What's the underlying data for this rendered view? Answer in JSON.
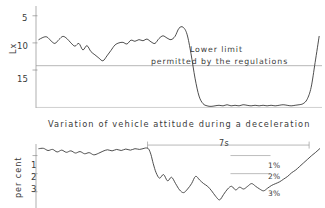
{
  "figure": {
    "caption": "Variation of vehicle attitude during a deceleration",
    "background_color": "#ffffff",
    "ink_color": "#2e2e2e",
    "axis_color": "#8d8d8d"
  },
  "top_chart": {
    "y_axis_title": "Lx",
    "y_ticks": [
      "5",
      "10",
      "15"
    ],
    "annotation_line1": "Lower limit",
    "annotation_line2": "permitted by the regulations"
  },
  "bottom_chart": {
    "y_axis_title": "per cent",
    "y_ticks": [
      "1",
      "2",
      "3"
    ],
    "span_label": "7s",
    "legend": [
      {
        "label": "1%"
      },
      {
        "label": "2%"
      },
      {
        "label": "3%"
      }
    ]
  },
  "chart_data": [
    {
      "type": "line",
      "id": "illuminance-vs-time",
      "title": "Variation of vehicle attitude during a deceleration",
      "xlabel": "",
      "ylabel": "Lx",
      "y_inverted": true,
      "ylim": [
        3.2,
        22.0
      ],
      "yticks": [
        5,
        10,
        15
      ],
      "xlim": [
        0,
        100
      ],
      "grid": false,
      "annotations": [
        {
          "text": "Lower limit permitted by the regulations",
          "x": 62,
          "y": 14.2,
          "refline_y": 14.2,
          "refline_style": "solid-thin"
        }
      ],
      "series": [
        {
          "name": "illuminance",
          "units": "Lx",
          "x": [
            1.0,
            2.4,
            3.8,
            5.2,
            6.6,
            8.0,
            9.4,
            10.8,
            12.2,
            13.6,
            15.0,
            16.4,
            17.8,
            19.2,
            20.6,
            22.0,
            23.4,
            24.8,
            26.2,
            27.6,
            29.0,
            30.4,
            31.8,
            33.2,
            34.6,
            36.0,
            37.4,
            38.8,
            40.2,
            41.6,
            43.0,
            44.4,
            45.8,
            47.2,
            48.6,
            50.0,
            51.4,
            52.8,
            54.2,
            55.6,
            57.0,
            58.4,
            59.8,
            61.2,
            62.6,
            64.0,
            65.4,
            66.8,
            68.2,
            69.6,
            71.0,
            72.4,
            73.8,
            75.2,
            76.6,
            78.0,
            79.4,
            80.8,
            82.2,
            83.6,
            85.0,
            86.4,
            87.8,
            89.2,
            90.6,
            92.0,
            93.4,
            94.8,
            96.2,
            97.6,
            99.0
          ],
          "y": [
            9.4,
            9.0,
            8.9,
            9.6,
            10.1,
            9.4,
            8.8,
            9.2,
            10.0,
            10.6,
            10.1,
            11.3,
            10.5,
            11.6,
            12.2,
            12.8,
            13.3,
            12.4,
            11.4,
            10.4,
            10.0,
            9.9,
            10.2,
            9.5,
            9.7,
            9.4,
            9.6,
            9.3,
            9.8,
            10.1,
            9.2,
            8.7,
            9.1,
            9.4,
            8.8,
            7.3,
            7.1,
            8.4,
            12.0,
            16.5,
            19.8,
            21.2,
            21.6,
            21.7,
            21.6,
            21.5,
            21.6,
            21.4,
            21.6,
            21.5,
            21.6,
            21.4,
            21.5,
            21.6,
            21.5,
            21.6,
            21.5,
            21.6,
            21.5,
            21.6,
            21.5,
            21.4,
            21.5,
            21.6,
            21.5,
            21.4,
            21.2,
            20.4,
            18.2,
            13.6,
            8.8
          ]
        }
      ]
    },
    {
      "type": "line",
      "id": "attitude-percent-vs-time",
      "title": "",
      "xlabel": "",
      "ylabel": "per cent",
      "y_inverted": true,
      "ylim": [
        0.25,
        3.9
      ],
      "yticks": [
        1,
        2,
        3
      ],
      "xlim": [
        0,
        100
      ],
      "grid": false,
      "annotations": [
        {
          "text": "7s",
          "type": "span",
          "x_start": 39.0,
          "x_end": 95.5,
          "y": 0.42
        },
        {
          "text": "1%",
          "type": "legend-refline",
          "y": 1.0,
          "x_start": 68,
          "x_end": 82
        },
        {
          "text": "2%",
          "type": "legend-refline",
          "y": 2.0,
          "x_start": 68,
          "x_end": 82
        },
        {
          "text": "3%",
          "type": "legend-refline",
          "y": 3.0,
          "x_start": 68,
          "x_end": 82
        }
      ],
      "series": [
        {
          "name": "attitude-variation",
          "units": "per cent",
          "x": [
            1.0,
            2.6,
            4.2,
            5.8,
            7.4,
            9.0,
            10.6,
            12.2,
            13.8,
            15.4,
            17.0,
            18.6,
            20.2,
            21.8,
            23.4,
            25.0,
            26.6,
            28.2,
            29.8,
            31.4,
            33.0,
            34.6,
            36.2,
            37.8,
            38.6,
            39.4,
            40.2,
            41.0,
            42.0,
            43.2,
            44.6,
            46.0,
            47.4,
            48.8,
            50.2,
            51.6,
            53.0,
            54.4,
            55.8,
            57.2,
            58.6,
            60.0,
            61.4,
            62.8,
            64.2,
            65.6,
            67.0,
            68.4,
            69.8,
            71.2,
            72.6,
            74.0,
            75.4,
            76.8,
            78.2,
            79.6,
            81.0,
            82.4,
            83.8,
            85.2,
            86.6,
            88.0,
            89.4,
            90.8,
            92.2,
            93.6,
            95.0,
            96.4,
            97.8,
            99.2
          ],
          "y": [
            0.62,
            0.6,
            0.72,
            0.66,
            0.8,
            0.7,
            0.82,
            0.74,
            0.86,
            0.78,
            0.9,
            0.84,
            0.96,
            0.88,
            0.76,
            0.68,
            0.74,
            0.66,
            0.72,
            0.64,
            0.7,
            0.62,
            0.66,
            0.6,
            0.58,
            0.64,
            0.95,
            1.45,
            1.95,
            2.25,
            2.05,
            2.4,
            2.2,
            2.55,
            2.9,
            3.05,
            2.85,
            2.55,
            2.15,
            2.35,
            2.55,
            2.7,
            2.95,
            3.25,
            3.45,
            3.15,
            2.85,
            2.7,
            2.9,
            2.75,
            2.85,
            2.7,
            2.55,
            2.7,
            2.85,
            2.95,
            2.8,
            2.65,
            2.55,
            2.45,
            2.3,
            2.15,
            1.95,
            1.8,
            1.6,
            1.4,
            1.2,
            1.0,
            0.82,
            0.62
          ]
        }
      ]
    }
  ]
}
